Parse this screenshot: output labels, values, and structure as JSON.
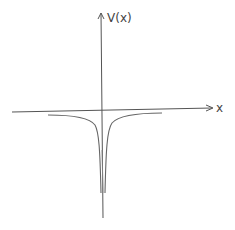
{
  "diagram": {
    "type": "potential-well-sketch",
    "y_axis_label": "V(x)",
    "x_axis_label": "x",
    "colors": {
      "axis": "#555555",
      "curve": "#666666",
      "background": "#ffffff"
    }
  }
}
